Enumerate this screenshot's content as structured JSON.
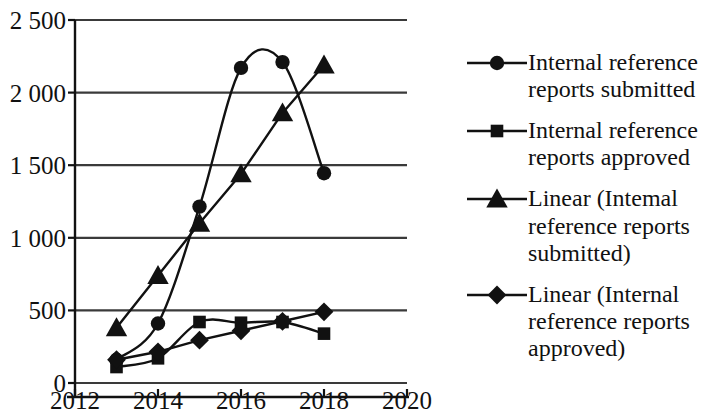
{
  "chart_data": {
    "type": "line",
    "title": "",
    "xlabel": "",
    "ylabel": "",
    "xlim": [
      2012,
      2020
    ],
    "ylim": [
      0,
      2500
    ],
    "xticks": [
      "2012",
      "2014",
      "2016",
      "2018",
      "2020"
    ],
    "xtick_values": [
      2012,
      2014,
      2016,
      2018,
      2020
    ],
    "yticks": [
      "0",
      "500",
      "1 000",
      "1 500",
      "2 000",
      "2 500"
    ],
    "ytick_values": [
      0,
      500,
      1000,
      1500,
      2000,
      2500
    ],
    "grid": "horizontal",
    "legend_position": "right",
    "x": [
      2013,
      2014,
      2015,
      2016,
      2017,
      2018
    ],
    "series": [
      {
        "name": "Internal reference reports submitted",
        "marker": "circle",
        "smooth": true,
        "values": [
          160,
          410,
          1215,
          2170,
          2210,
          1445
        ]
      },
      {
        "name": "Internal reference reports approved",
        "marker": "square",
        "smooth": true,
        "values": [
          110,
          170,
          420,
          415,
          420,
          340
        ]
      },
      {
        "name": "Linear (Intemal reference reports submitted)",
        "marker": "triangle",
        "smooth": false,
        "values": [
          380,
          740,
          1100,
          1440,
          1860,
          2190
        ]
      },
      {
        "name": "Linear (Internal reference reports approved)",
        "marker": "diamond",
        "smooth": false,
        "values": [
          160,
          215,
          295,
          360,
          425,
          490
        ]
      }
    ]
  },
  "legend": {
    "entries": [
      {
        "label": "Internal reference reports submitted",
        "marker": "circle-marker-icon"
      },
      {
        "label": "Internal reference reports approved",
        "marker": "square-marker-icon"
      },
      {
        "label": "Linear (Intemal reference reports submitted)",
        "marker": "triangle-marker-icon"
      },
      {
        "label": "Linear (Internal reference reports approved)",
        "marker": "diamond-marker-icon"
      }
    ]
  },
  "colors": {
    "ink": "#111111",
    "grid": "#3a3a3a",
    "background": "#ffffff"
  }
}
